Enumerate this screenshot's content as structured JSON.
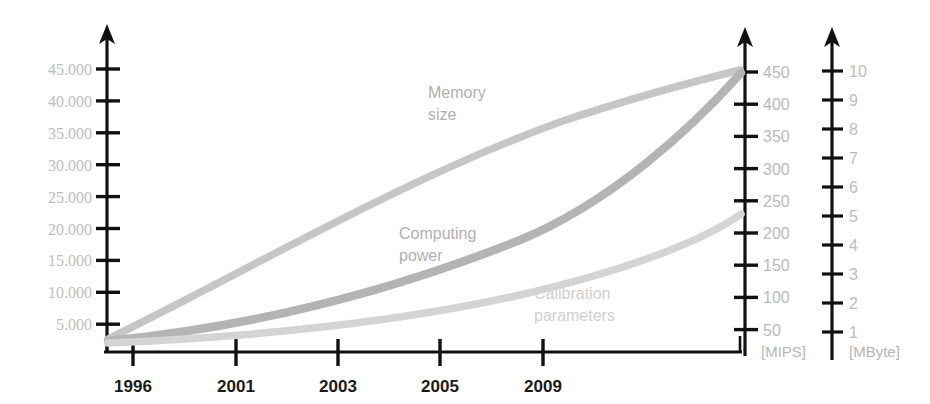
{
  "chart_data": {
    "type": "line",
    "title": "",
    "subtitle": "",
    "xlabel": "",
    "ylabel": "",
    "grid": false,
    "legend_position": "inline-annotations",
    "x": [
      "1996",
      "2001",
      "2003",
      "2005",
      "2009"
    ],
    "xlim": [
      "1996",
      "beyond 2009"
    ],
    "axes": [
      {
        "id": "left",
        "position": "left",
        "unit": "",
        "ticks": [
          "5.000",
          "10.000",
          "15.000",
          "20.000",
          "25.000",
          "30.000",
          "35.000",
          "40.000",
          "45.000"
        ],
        "tick_values": [
          5000,
          10000,
          15000,
          20000,
          25000,
          30000,
          35000,
          40000,
          45000
        ],
        "ylim": [
          0,
          47500
        ],
        "bound_series": "Calibration parameters"
      },
      {
        "id": "mips",
        "position": "right",
        "unit": "[MIPS]",
        "ticks": [
          "50",
          "100",
          "150",
          "200",
          "250",
          "300",
          "350",
          "400",
          "450"
        ],
        "tick_values": [
          50,
          100,
          150,
          200,
          250,
          300,
          350,
          400,
          450
        ],
        "ylim": [
          0,
          475
        ],
        "bound_series": "Computing power"
      },
      {
        "id": "mbyte",
        "position": "right",
        "unit": "[MByte]",
        "ticks": [
          "1",
          "2",
          "3",
          "4",
          "5",
          "6",
          "7",
          "8",
          "9",
          "10"
        ],
        "tick_values": [
          1,
          2,
          3,
          4,
          5,
          6,
          7,
          8,
          9,
          10
        ],
        "ylim": [
          0,
          10.8
        ],
        "bound_series": "Memory size"
      }
    ],
    "series": [
      {
        "name": "Memory size",
        "label": "Memory size",
        "label_line1": "Memory",
        "label_line2": "size",
        "axis": "mbyte",
        "color": "#c6c6c6",
        "shape": "near-linear rising",
        "values": [
          0.3,
          2.6,
          4.3,
          6.1,
          8.6,
          10.4
        ],
        "x_values": [
          "1996",
          "2001",
          "2003",
          "2005",
          "2009",
          "end"
        ]
      },
      {
        "name": "Computing power",
        "label": "Computing power",
        "label_line1": "Computing",
        "label_line2": "power",
        "axis": "mips",
        "color": "#b4b4b4",
        "shape": "convex exponential",
        "values": [
          5,
          45,
          90,
          150,
          290,
          450
        ],
        "x_values": [
          "1996",
          "2001",
          "2003",
          "2005",
          "2009",
          "end"
        ]
      },
      {
        "name": "Calibration parameters",
        "label": "Calibration parameters",
        "label_line1": "Calibration",
        "label_line2": "parameters",
        "axis": "left",
        "color": "#d4d4d4",
        "shape": "slow convex rise",
        "values": [
          2000,
          5000,
          7500,
          10500,
          17000,
          25500
        ],
        "x_values": [
          "1996",
          "2001",
          "2003",
          "2005",
          "2009",
          "end"
        ]
      }
    ],
    "colors": {
      "axis": "#111111",
      "tick_label": "#bdbdbd",
      "x_tick_label": "#1a1a1a",
      "background": "#ffffff"
    }
  }
}
